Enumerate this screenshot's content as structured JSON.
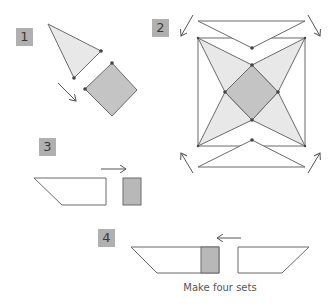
{
  "steps": [
    {
      "number": "1"
    },
    {
      "number": "2"
    },
    {
      "number": "3"
    },
    {
      "number": "4"
    }
  ],
  "caption": "Make four sets",
  "colors": {
    "label_bg": "#b0b0b0",
    "light_fill": "#e8e8e8",
    "dark_fill": "#c4c4c4",
    "stroke": "#6a6a6a",
    "dot": "#444444"
  }
}
